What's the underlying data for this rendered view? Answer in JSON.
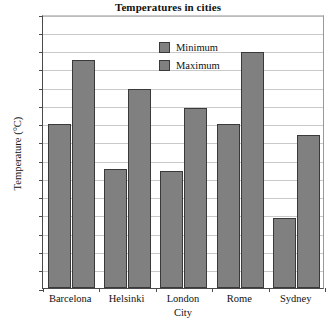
{
  "chart_data": {
    "type": "bar",
    "title": "Temperatures in cities",
    "xlabel": "City",
    "ylabel": "Temperature (°C)",
    "categories": [
      "Barcelona",
      "Helsinki",
      "London",
      "Rome",
      "Sydney"
    ],
    "series": [
      {
        "name": "Minimum",
        "values": [
          18,
          13,
          12.8,
          18,
          7.7
        ],
        "color": "#808080"
      },
      {
        "name": "Maximum",
        "values": [
          25,
          21.8,
          19.7,
          25.8,
          16.8
        ],
        "color": "#808080"
      }
    ],
    "ylim": [
      0,
      30
    ],
    "ytick_step": 2,
    "yticks": [
      0,
      2,
      4,
      6,
      8,
      10,
      12,
      14,
      16,
      18,
      20,
      22,
      24,
      26,
      28,
      30
    ],
    "grid": true,
    "grid_axis": "y",
    "legend_position": "upper-center-inside",
    "bar_edge_color": "#3a3a3a",
    "grid_color": "#c9c9c9",
    "axis_color": "#4a4a4a"
  },
  "legend": {
    "entries": [
      {
        "label": "Minimum"
      },
      {
        "label": "Maximum"
      }
    ]
  }
}
